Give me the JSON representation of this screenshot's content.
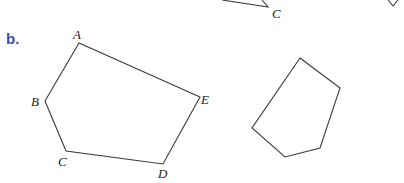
{
  "part_label": "b.",
  "top_fragment": {
    "vertex_label": "C"
  },
  "figure_left": {
    "name": "pentagon ABCDE",
    "vertices": [
      {
        "label": "A",
        "x": 79,
        "y": 43
      },
      {
        "label": "B",
        "x": 45,
        "y": 101
      },
      {
        "label": "C",
        "x": 66,
        "y": 151
      },
      {
        "label": "D",
        "x": 163,
        "y": 164
      },
      {
        "label": "E",
        "x": 200,
        "y": 97
      }
    ]
  },
  "figure_right": {
    "name": "unlabeled pentagon",
    "vertices": [
      {
        "x": 300,
        "y": 58
      },
      {
        "x": 340,
        "y": 88
      },
      {
        "x": 320,
        "y": 148
      },
      {
        "x": 285,
        "y": 157
      },
      {
        "x": 252,
        "y": 128
      }
    ]
  },
  "colors": {
    "label_blue": "#3b4ea3",
    "stroke": "#3a3a3a"
  }
}
